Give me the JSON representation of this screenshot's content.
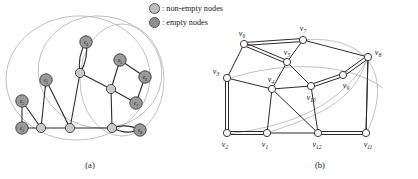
{
  "figure": {
    "width": 418,
    "height": 179,
    "background": "#ffffff"
  },
  "legend": {
    "items": [
      {
        "id": "non-empty",
        "marker": "circle-light",
        "separator": ":",
        "label": "non-empty nodes",
        "fill": "#bdbdbd",
        "stroke": "#5c5c5c"
      },
      {
        "id": "empty",
        "marker": "circle-dark",
        "separator": ":",
        "label": "empty nodes",
        "fill": "#8f8f8f",
        "stroke": "#5c5c5c"
      }
    ]
  },
  "captions": {
    "a": "(a)",
    "b": "(b)"
  },
  "colors": {
    "edge": "#2b2b2b",
    "ellipse": "#b3b3b3",
    "node_filled": "#9a9a9a",
    "node_open": "#ffffff",
    "node_stroke": "#3a3a3a",
    "text": "#1a1a1a"
  },
  "panel_a": {
    "title": "(a)",
    "nodes": [
      {
        "id": "e1",
        "label": "e1",
        "x": 22,
        "y": 128,
        "type": "empty",
        "labeled": true
      },
      {
        "id": "e2",
        "label": "e2",
        "x": 22,
        "y": 101,
        "type": "empty",
        "labeled": true
      },
      {
        "id": "e3",
        "label": "e3",
        "x": 46,
        "y": 80,
        "type": "empty",
        "labeled": true
      },
      {
        "id": "e4",
        "label": "e4",
        "x": 86,
        "y": 42,
        "type": "empty",
        "labeled": true
      },
      {
        "id": "e5",
        "label": "e5",
        "x": 120,
        "y": 60,
        "type": "empty",
        "labeled": true
      },
      {
        "id": "e6",
        "label": "e6",
        "x": 145,
        "y": 77,
        "type": "empty",
        "labeled": true
      },
      {
        "id": "e7",
        "label": "e7",
        "x": 136,
        "y": 103,
        "type": "empty",
        "labeled": true
      },
      {
        "id": "e8",
        "label": "e8",
        "x": 140,
        "y": 130,
        "type": "empty",
        "labeled": true
      },
      {
        "id": "n1",
        "label": "",
        "x": 41,
        "y": 128,
        "type": "non-empty",
        "labeled": false
      },
      {
        "id": "n2",
        "label": "",
        "x": 70,
        "y": 128,
        "type": "non-empty",
        "labeled": false
      },
      {
        "id": "n3",
        "label": "",
        "x": 80,
        "y": 73,
        "type": "non-empty",
        "labeled": false
      },
      {
        "id": "n4",
        "label": "",
        "x": 111,
        "y": 89,
        "type": "non-empty",
        "labeled": false
      },
      {
        "id": "n5",
        "label": "",
        "x": 112,
        "y": 128,
        "type": "non-empty",
        "labeled": false
      }
    ],
    "edges": [
      {
        "from": "e1",
        "to": "e2"
      },
      {
        "from": "e1",
        "to": "n1"
      },
      {
        "from": "e2",
        "to": "n1"
      },
      {
        "from": "e3",
        "to": "n1"
      },
      {
        "from": "e3",
        "to": "n2"
      },
      {
        "from": "n1",
        "to": "n2"
      },
      {
        "from": "n2",
        "to": "n3"
      },
      {
        "from": "n2",
        "to": "n5"
      },
      {
        "from": "n3",
        "to": "n4"
      },
      {
        "from": "n4",
        "to": "e5"
      },
      {
        "from": "n4",
        "to": "e7"
      },
      {
        "from": "n4",
        "to": "n5"
      },
      {
        "from": "e5",
        "to": "e6"
      },
      {
        "from": "e6",
        "to": "e7"
      }
    ],
    "multi_edges": [
      {
        "from": "e4",
        "to": "n3",
        "count": 2,
        "note": "double-edge bubble"
      },
      {
        "from": "n5",
        "to": "e8",
        "count": 2,
        "note": "double-edge bubble"
      }
    ],
    "ellipses": [
      {
        "cx": 78,
        "cy": 78,
        "rx": 72,
        "ry": 62,
        "rot": -4
      },
      {
        "cx": 100,
        "cy": 72,
        "rx": 62,
        "ry": 56,
        "rot": 8
      },
      {
        "cx": 122,
        "cy": 80,
        "rx": 42,
        "ry": 56,
        "rot": 0
      }
    ]
  },
  "panel_b": {
    "title": "(b)",
    "nodes": [
      {
        "id": "v1",
        "label": "v1",
        "x": 52,
        "y": 133,
        "label_dx": -2,
        "label_dy": 14,
        "anchor": "middle"
      },
      {
        "id": "v2",
        "label": "v2",
        "x": 12,
        "y": 133,
        "label_dx": -2,
        "label_dy": 14,
        "anchor": "middle"
      },
      {
        "id": "v3",
        "label": "v3",
        "x": 12,
        "y": 78,
        "label_dx": -11,
        "label_dy": -4,
        "anchor": "middle"
      },
      {
        "id": "v4",
        "label": "v4",
        "x": 57,
        "y": 89,
        "label_dx": -1,
        "label_dy": -7,
        "anchor": "middle"
      },
      {
        "id": "v5",
        "label": "v5",
        "x": 72,
        "y": 62,
        "label_dx": 0,
        "label_dy": -7,
        "anchor": "middle"
      },
      {
        "id": "v6",
        "label": "v6",
        "x": 29,
        "y": 44,
        "label_dx": -2,
        "label_dy": -8,
        "anchor": "middle"
      },
      {
        "id": "v7",
        "label": "v7",
        "x": 88,
        "y": 40,
        "label_dx": 0,
        "label_dy": -9,
        "anchor": "middle"
      },
      {
        "id": "v8",
        "label": "v8",
        "x": 153,
        "y": 57,
        "label_dx": 10,
        "label_dy": -2,
        "anchor": "middle"
      },
      {
        "id": "v9",
        "label": "v9",
        "x": 128,
        "y": 75,
        "label_dx": 3,
        "label_dy": 13,
        "anchor": "middle"
      },
      {
        "id": "v10",
        "label": "v10",
        "x": 96,
        "y": 86,
        "label_dx": 0,
        "label_dy": 14,
        "anchor": "middle"
      },
      {
        "id": "v11",
        "label": "v11",
        "x": 151,
        "y": 133,
        "label_dx": 2,
        "label_dy": 14,
        "anchor": "middle"
      },
      {
        "id": "v12",
        "label": "v12",
        "x": 103,
        "y": 133,
        "label_dx": -1,
        "label_dy": 14,
        "anchor": "middle"
      }
    ],
    "edges": [
      {
        "from": "v2",
        "to": "v1"
      },
      {
        "from": "v1",
        "to": "v12"
      },
      {
        "from": "v12",
        "to": "v11"
      },
      {
        "from": "v3",
        "to": "v2"
      },
      {
        "from": "v3",
        "to": "v6"
      },
      {
        "from": "v3",
        "to": "v4"
      },
      {
        "from": "v4",
        "to": "v1"
      },
      {
        "from": "v4",
        "to": "v5"
      },
      {
        "from": "v4",
        "to": "v10"
      },
      {
        "from": "v4",
        "to": "v12"
      },
      {
        "from": "v6",
        "to": "v7"
      },
      {
        "from": "v6",
        "to": "v5"
      },
      {
        "from": "v5",
        "to": "v7"
      },
      {
        "from": "v5",
        "to": "v10"
      },
      {
        "from": "v7",
        "to": "v8"
      },
      {
        "from": "v8",
        "to": "v9"
      },
      {
        "from": "v8",
        "to": "v11"
      },
      {
        "from": "v9",
        "to": "v10"
      },
      {
        "from": "v10",
        "to": "v12"
      },
      {
        "from": "v11",
        "to": "v8"
      }
    ],
    "double_edges": [
      {
        "from": "v2",
        "to": "v1"
      },
      {
        "from": "v12",
        "to": "v11"
      },
      {
        "from": "v3",
        "to": "v2"
      },
      {
        "from": "v6",
        "to": "v7"
      },
      {
        "from": "v6",
        "to": "v5"
      },
      {
        "from": "v8",
        "to": "v9"
      },
      {
        "from": "v9",
        "to": "v10"
      }
    ],
    "gray_curves": [
      {
        "id": "curve-1",
        "d": "M 10 80 C 60 62, 130 60, 168 88",
        "note": "v3 to right sweep"
      },
      {
        "id": "curve-2",
        "d": "M 86 40 C 150 34, 180 72, 152 132",
        "note": "v7 around right"
      },
      {
        "id": "curve-3",
        "d": "M 52 133 C 96 118, 140 104, 152 58",
        "note": "v1 to v8 arc"
      },
      {
        "id": "curve-4",
        "d": "M 13 134 C 70 126, 120 112, 154 58",
        "note": "v2 to v8 arc"
      }
    ]
  }
}
